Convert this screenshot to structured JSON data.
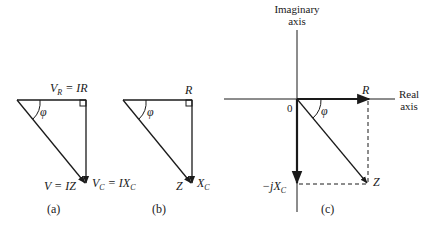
{
  "diagram": {
    "panel_a": {
      "caption": "(a)",
      "top_label": {
        "v": "V",
        "sub": "R",
        "eq": " = IR"
      },
      "angle": "φ",
      "hyp_label": "V = IZ",
      "vert_label": {
        "v": "V",
        "sub": "C",
        "eq": " = IX",
        "sub2": "C"
      }
    },
    "panel_b": {
      "caption": "(b)",
      "top_label": "R",
      "angle": "φ",
      "hyp_label": "Z",
      "vert_label": {
        "v": "X",
        "sub": "C"
      }
    },
    "panel_c": {
      "caption": "(c)",
      "imag_axis_label": [
        "Imaginary",
        "axis"
      ],
      "real_axis_label": [
        "Real",
        "axis"
      ],
      "origin": "0",
      "r_label": "R",
      "angle": "φ",
      "z_label": "Z",
      "neg_label": {
        "pre": "−j",
        "v": "X",
        "sub": "C"
      }
    }
  }
}
